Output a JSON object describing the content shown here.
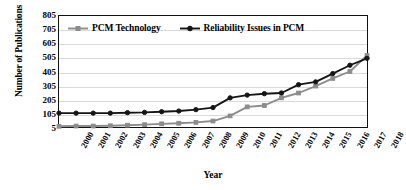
{
  "chart_data": {
    "type": "line",
    "title": "",
    "xlabel": "Year",
    "ylabel": "Number of Publications",
    "categories": [
      2000,
      2001,
      2002,
      2003,
      2004,
      2005,
      2006,
      2007,
      2008,
      2009,
      2010,
      2011,
      2012,
      2013,
      2014,
      2015,
      2016,
      2017,
      2018
    ],
    "xlim": [
      2000,
      2018
    ],
    "ylim": [
      5,
      805
    ],
    "yticks": [
      5,
      105,
      205,
      305,
      405,
      505,
      605,
      705,
      805
    ],
    "xticks": [
      "2000",
      "2001",
      "2002",
      "2003",
      "2004",
      "2005",
      "2006",
      "2007",
      "2008",
      "2009",
      "2010",
      "2011",
      "2012",
      "2013",
      "2014",
      "2015",
      "2016",
      "2017",
      "2018"
    ],
    "grid": true,
    "legend_position": "top-left",
    "series": [
      {
        "name": "PCM Technology",
        "color": "#8c8c8c",
        "marker": "square",
        "values": [
          10,
          12,
          12,
          14,
          18,
          22,
          28,
          32,
          38,
          48,
          85,
          150,
          160,
          215,
          250,
          300,
          355,
          405,
          520
        ]
      },
      {
        "name": "Reliability Issues in PCM",
        "color": "#151515",
        "marker": "circle",
        "values": [
          105,
          105,
          105,
          105,
          108,
          110,
          115,
          120,
          130,
          145,
          215,
          235,
          245,
          250,
          310,
          330,
          390,
          450,
          500
        ]
      }
    ]
  },
  "legend": {
    "items": [
      {
        "label": "PCM Technology",
        "color": "#8c8c8c"
      },
      {
        "label": "Reliability Issues in PCM",
        "color": "#151515"
      }
    ]
  },
  "axes": {
    "y_title": "Number of Publications",
    "x_title": "Year"
  }
}
